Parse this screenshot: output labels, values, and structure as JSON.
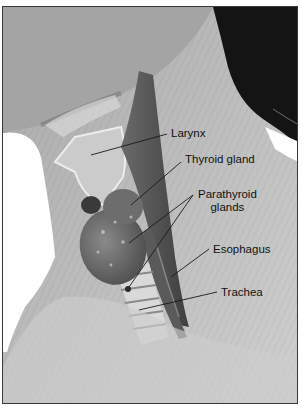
{
  "figure": {
    "labels": [
      {
        "id": "larynx",
        "text": "Larynx"
      },
      {
        "id": "thyroid",
        "text": "Thyroid gland"
      },
      {
        "id": "parathyroid_line1",
        "text": "Parathyroid"
      },
      {
        "id": "parathyroid_line2",
        "text": "glands"
      },
      {
        "id": "esophagus",
        "text": "Esophagus"
      },
      {
        "id": "trachea",
        "text": "Trachea"
      }
    ],
    "colors": {
      "skin": "#b9b9b9",
      "skin_light": "#d2d2d2",
      "hair": "#141414",
      "muscle": "#555555",
      "gland": "#707070",
      "background": "#ffffff",
      "leader_line": "#1a1a1a"
    }
  }
}
